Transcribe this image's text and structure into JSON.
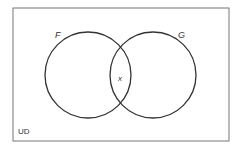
{
  "diagram": {
    "type": "venn",
    "universe_label": "UD",
    "sets": [
      {
        "name": "F",
        "cx": 88,
        "cy": 75,
        "r": 43,
        "label_x": 57,
        "label_y": 37
      },
      {
        "name": "G",
        "cx": 153,
        "cy": 75,
        "r": 43,
        "label_x": 181,
        "label_y": 38
      }
    ],
    "intersection_label": "x",
    "colors": {
      "stroke": "#333333",
      "frame": "#777777"
    }
  }
}
